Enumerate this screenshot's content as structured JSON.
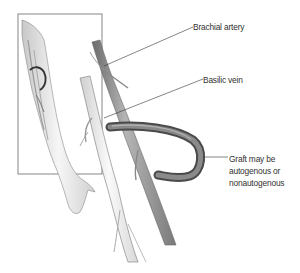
{
  "figure": {
    "labels": {
      "brachial_artery": "Brachial artery",
      "basilic_vein": "Basilic vein",
      "graft_line1": "Graft may be",
      "graft_line2": "autogenous or",
      "graft_line3": "nonautogenous"
    },
    "colors": {
      "artery": "#8c8c8c",
      "vein": "#e8e8e8",
      "graft": "#6e6e6e",
      "outline": "#555555",
      "text": "#333333",
      "inset_border": "#666666"
    }
  }
}
